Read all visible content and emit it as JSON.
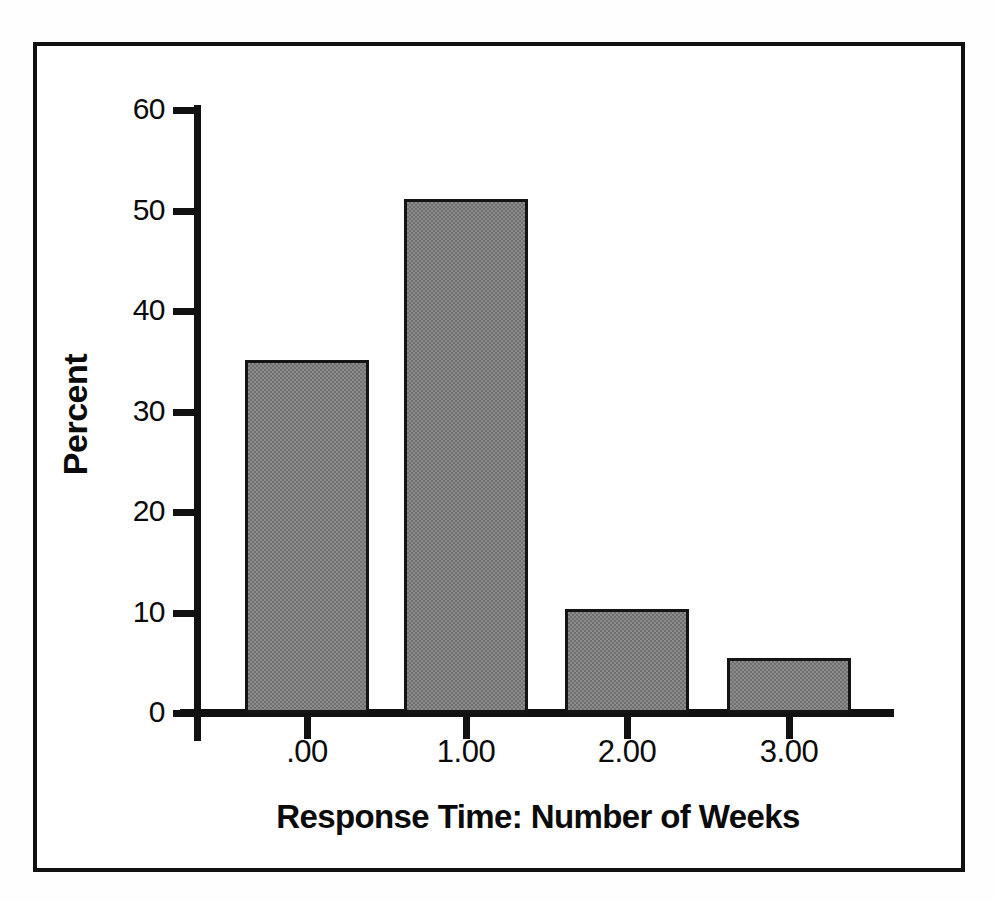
{
  "chart_data": {
    "type": "bar",
    "title": "",
    "xlabel": "Response Time: Number of Weeks",
    "ylabel": "Percent",
    "categories": [
      ".00",
      "1.00",
      "2.00",
      "3.00"
    ],
    "values": [
      35.1,
      51.1,
      10.3,
      5.5
    ],
    "ylim": [
      0,
      60
    ],
    "yticks": [
      0,
      10,
      20,
      30,
      40,
      50,
      60
    ],
    "ytick_labels": [
      "0",
      "10",
      "20",
      "30",
      "40",
      "50",
      "60"
    ],
    "grid": false,
    "legend": null,
    "bar_fill_color": "#808080",
    "bar_edge_color": "#141414",
    "axis_color": "#111111",
    "background_color": "#ffffff",
    "frame_border_color": "#111111"
  },
  "figure": {
    "frame_label": "chart-border-frame",
    "canvas_label": "plot-area"
  }
}
